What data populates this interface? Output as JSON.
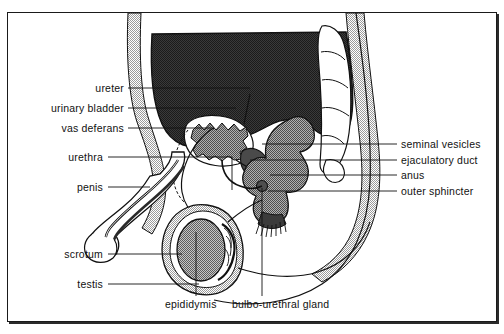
{
  "figure": {
    "background_color": "#ffffff",
    "frame_color": "#1a1a1a",
    "text_color": "#111111"
  },
  "labels": {
    "left": [
      {
        "id": "ureter",
        "text": "ureter",
        "text_right_x": 124,
        "y": 88,
        "leader": [
          [
            128,
            88
          ],
          [
            206,
            88
          ]
        ]
      },
      {
        "id": "urinary-bladder",
        "text": "urinary  bladder",
        "text_right_x": 124,
        "y": 108,
        "leader": [
          [
            128,
            108
          ],
          [
            212,
            108
          ]
        ]
      },
      {
        "id": "vas-deferans",
        "text": "vas  deferans",
        "text_right_x": 124,
        "y": 128,
        "leader": [
          [
            128,
            128
          ],
          [
            214,
            128
          ]
        ]
      },
      {
        "id": "urethra",
        "text": "urethra",
        "text_right_x": 103,
        "y": 157,
        "leader": [
          [
            108,
            157
          ],
          [
            180,
            157
          ]
        ]
      },
      {
        "id": "penis",
        "text": "penis",
        "text_right_x": 103,
        "y": 187,
        "leader": [
          [
            108,
            187
          ],
          [
            146,
            187
          ]
        ]
      },
      {
        "id": "scrotum",
        "text": "scrotum",
        "text_right_x": 103,
        "y": 254,
        "leader": [
          [
            108,
            254
          ],
          [
            178,
            254
          ]
        ]
      },
      {
        "id": "testis",
        "text": "testis",
        "text_right_x": 103,
        "y": 284,
        "leader": [
          [
            108,
            284
          ],
          [
            196,
            284
          ]
        ]
      }
    ],
    "right": [
      {
        "id": "seminal-vesicles",
        "text": "seminal  vesicles",
        "text_left_x": 401,
        "y": 144,
        "leader": [
          [
            316,
            144
          ],
          [
            397,
            144
          ]
        ]
      },
      {
        "id": "ejaculatory-duct",
        "text": "ejaculatory  duct",
        "text_left_x": 401,
        "y": 160,
        "leader": [
          [
            312,
            160
          ],
          [
            397,
            160
          ]
        ]
      },
      {
        "id": "anus",
        "text": "anus",
        "text_left_x": 401,
        "y": 175,
        "leader": [
          [
            320,
            175
          ],
          [
            397,
            175
          ]
        ]
      },
      {
        "id": "outer-sphincter",
        "text": "outer  sphincter",
        "text_left_x": 401,
        "y": 191,
        "leader": [
          [
            318,
            191
          ],
          [
            397,
            191
          ]
        ]
      }
    ],
    "bottom": [
      {
        "id": "epididymis",
        "text": "epididymis",
        "text_left_x": 165,
        "y": 305,
        "leader": [
          [
            196,
            296
          ],
          [
            196,
            232
          ]
        ]
      },
      {
        "id": "bulbo-urethral-gland",
        "text": "bulbo-urethral  gland",
        "text_left_x": 232,
        "y": 305,
        "leader": [
          [
            262,
            296
          ],
          [
            262,
            186
          ]
        ]
      }
    ]
  },
  "anatomy": {
    "structures": [
      {
        "id": "bladder-dark",
        "name": "urinary bladder",
        "fill": "#2e2e2e",
        "description": "large dark filled organ in upper pelvis"
      },
      {
        "id": "body-wall",
        "name": "abdominal and pelvic wall",
        "fill": "#c9c9c9",
        "description": "light stippled gray band following body contour"
      },
      {
        "id": "rectum",
        "name": "rectum",
        "fill": "#6d6d6d",
        "description": "medium gray lobed tube posterior to bladder"
      },
      {
        "id": "prostate",
        "name": "prostate",
        "fill": "#5a5a5a",
        "description": "jagged outlined gland below bladder neck"
      },
      {
        "id": "sacrum",
        "name": "sacrum / coccyx",
        "fill": "#d2d2d2",
        "description": "segmented vertebral column at posterior"
      },
      {
        "id": "testis",
        "name": "testis",
        "fill": "#8c8c8c",
        "description": "oval organ within scrotum"
      },
      {
        "id": "seminal-vesicle",
        "name": "seminal vesicle",
        "fill": "#4a4a4a",
        "description": "small sac behind prostate"
      },
      {
        "id": "penis-shaft",
        "name": "penis",
        "fill": "#ffffff",
        "description": "anterior curved shaft with urethral canal"
      },
      {
        "id": "scrotum-sac",
        "name": "scrotum",
        "fill": "#c9c9c9",
        "description": "pouch enclosing testis"
      },
      {
        "id": "vas-deferens-tube",
        "name": "vas deferens",
        "fill": "none",
        "description": "looping duct from testis to prostate"
      }
    ],
    "line_color": "#111111"
  }
}
